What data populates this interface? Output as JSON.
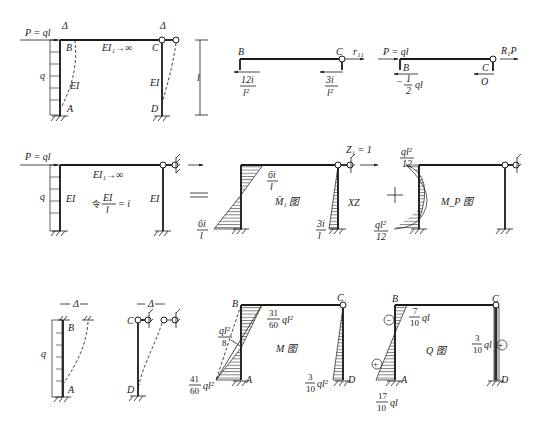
{
  "figure": {
    "row1": {
      "original_structure": {
        "load_label": "P = ql",
        "delta_label_left": "Δ",
        "delta_label_right": "Δ",
        "node_B": "B",
        "node_C": "C",
        "node_A": "A",
        "node_D": "D",
        "beam_stiffness": "EI₁→∞",
        "col_left_stiffness": "EI",
        "col_right_stiffness": "EI",
        "distributed_load": "q",
        "height_label": "l"
      },
      "free_body_r11": {
        "node_B": "B",
        "node_C": "C",
        "reaction": "r₁₁",
        "shear_B_num": "12i",
        "shear_B_den": "l²",
        "shear_C_num": "3i",
        "shear_C_den": "l²"
      },
      "free_body_R1P": {
        "load_label": "P = ql",
        "node_B": "B",
        "node_C": "C",
        "reaction": "R₁P",
        "shear_B_prefix": "−",
        "shear_B_num": "1",
        "shear_B_den": "2",
        "shear_B_suffix": "ql",
        "shear_C": "O"
      }
    },
    "row2": {
      "basic_structure": {
        "load_label": "P = ql",
        "beam_stiffness": "EI₁→∞",
        "distributed_load": "q",
        "col_left_stiffness": "EI",
        "col_right_stiffness": "EI",
        "definition_prefix": "令",
        "definition_num": "EI",
        "definition_den": "l",
        "definition_suffix": "= i"
      },
      "equals_sign": "=",
      "plus_sign": "+",
      "m1_diagram": {
        "unit_disp": "Z₁ = 1",
        "top_num": "6i",
        "top_den": "l",
        "bottom_num": "6i",
        "bottom_den": "l",
        "right_num": "3i",
        "right_den": "l",
        "title": "M̄₁ 图",
        "right_tag": "XZ"
      },
      "mp_diagram": {
        "top_num": "ql²",
        "top_den": "12",
        "bottom_num": "ql²",
        "bottom_den": "12",
        "title": "M_P 图"
      }
    },
    "row3": {
      "deformed_left_column": {
        "delta_label": "Δ",
        "node_B": "B",
        "node_A": "A",
        "distributed_load": "q"
      },
      "deformed_right_column": {
        "delta_label": "Δ",
        "node_C": "C",
        "node_D": "D"
      },
      "m_diagram": {
        "node_B": "B",
        "node_C": "C",
        "node_A": "A",
        "node_D": "D",
        "top_num": "31",
        "top_den": "60",
        "top_suffix": "ql²",
        "mid_num": "ql²",
        "mid_den": "8",
        "bottom_num": "41",
        "bottom_den": "60",
        "bottom_suffix": "ql²",
        "right_num": "3",
        "right_den": "10",
        "right_suffix": "ql²",
        "title": "M 图"
      },
      "q_diagram": {
        "node_B": "B",
        "node_C": "C",
        "node_A": "A",
        "node_D": "D",
        "top_num": "7",
        "top_den": "10",
        "top_suffix": "ql",
        "bottom_num": "17",
        "bottom_den": "10",
        "bottom_suffix": "ql",
        "right_num": "3",
        "right_den": "10",
        "right_suffix": "ql",
        "sign_minus": "−",
        "sign_plus_left": "+",
        "sign_plus_right": "+",
        "title": "Q 图"
      }
    }
  }
}
